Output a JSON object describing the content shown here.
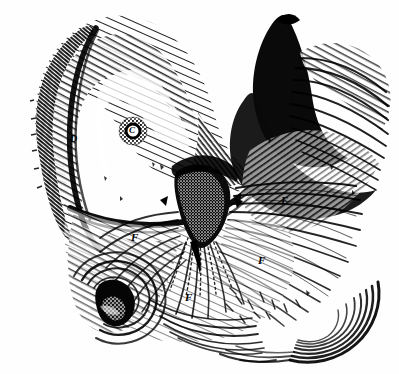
{
  "figure": {
    "kind": "anatomical-engraving",
    "technique": "wood-engraving cross-hatch",
    "background_color": "#fefefe",
    "ink_color": "#000000",
    "width": 399,
    "height": 374
  },
  "labels": [
    {
      "id": "label-c",
      "text": "C",
      "x": 129,
      "y": 127,
      "note": "ring / areolar structure"
    },
    {
      "id": "label-d",
      "text": "D",
      "x": 70,
      "y": 135,
      "note": "left flank of upper arch"
    },
    {
      "id": "label-e",
      "text": "E",
      "x": 281,
      "y": 195,
      "note": "right radiating field"
    },
    {
      "id": "label-f1",
      "text": "F",
      "x": 131,
      "y": 232,
      "note": "left lower radiating field"
    },
    {
      "id": "label-f2",
      "text": "F",
      "x": 258,
      "y": 255,
      "note": "right lower radiating field"
    },
    {
      "id": "label-f3",
      "text": "F",
      "x": 185,
      "y": 292,
      "note": "central lower radiating field"
    }
  ],
  "regions": [
    {
      "id": "upper-arch",
      "name": "upper crescent arch"
    },
    {
      "id": "dark-mass",
      "name": "central dark stippled mass"
    },
    {
      "id": "radiating-field",
      "name": "radiating striation field"
    },
    {
      "id": "orifice",
      "name": "lower-left dark orifice"
    },
    {
      "id": "right-shadow",
      "name": "right upper deep shadow"
    },
    {
      "id": "lower-sweep",
      "name": "lower-right sweeping curve"
    }
  ]
}
